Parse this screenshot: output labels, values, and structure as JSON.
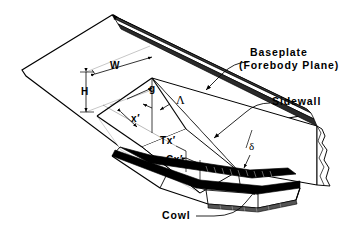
{
  "figure": {
    "name": "sidewall-compression-inlet-schematic",
    "line_color": "#000000",
    "fill_color": "#ffffff",
    "background": "#ffffff"
  },
  "callouts": [
    {
      "id": "baseplate",
      "line1": "Baseplate",
      "line2": "(Forebody Plane)"
    },
    {
      "id": "sidewall",
      "line1": "Sidewall",
      "line2": ""
    },
    {
      "id": "cowl",
      "line1": "Cowl",
      "line2": ""
    }
  ],
  "dimensions": [
    {
      "id": "width",
      "label": "W",
      "meaning": "inlet entrance width"
    },
    {
      "id": "height",
      "label": "H",
      "meaning": "inlet entrance height"
    },
    {
      "id": "throat-gap",
      "label": "g",
      "meaning": "throat gap"
    },
    {
      "id": "sweep-angle",
      "label": "Λ",
      "meaning": "leading edge sweep angle"
    },
    {
      "id": "axial-station",
      "label": "x′",
      "meaning": "axial distance along inlet"
    },
    {
      "id": "throat-station",
      "label": "Tx′",
      "meaning": "throat axial station"
    },
    {
      "id": "cowl-station",
      "label": "Cx′",
      "meaning": "cowl axial station"
    },
    {
      "id": "wall-angle",
      "label": "δ",
      "meaning": "sidewall compression angle"
    }
  ]
}
